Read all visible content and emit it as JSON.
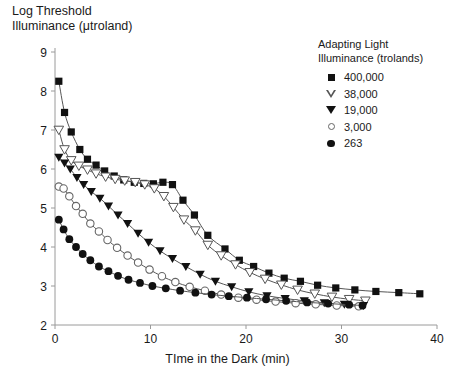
{
  "chart_data": {
    "type": "scatter",
    "title": "",
    "ylabel": "Log Threshold\nIlluminance (μtroland)",
    "xlabel": "TIme in the Dark (min)",
    "xlim": [
      0,
      40
    ],
    "ylim": [
      2,
      9
    ],
    "xticks": [
      0,
      10,
      20,
      30,
      40
    ],
    "yticks": [
      2,
      3,
      4,
      5,
      6,
      7,
      8,
      9
    ],
    "grid": false,
    "legend_position": "top-right",
    "legend_title": "Adapting Light\nIlluminance (trolands)",
    "series": [
      {
        "name": "400,000",
        "marker": "filled-square",
        "color": "#111111",
        "points": [
          [
            0.4,
            8.25
          ],
          [
            1.0,
            7.45
          ],
          [
            1.7,
            6.95
          ],
          [
            2.6,
            6.5
          ],
          [
            3.4,
            6.25
          ],
          [
            4.3,
            6.1
          ],
          [
            5.2,
            5.95
          ],
          [
            6.2,
            5.82
          ],
          [
            7.2,
            5.72
          ],
          [
            8.3,
            5.66
          ],
          [
            9.3,
            5.63
          ],
          [
            10.3,
            5.62
          ],
          [
            11.3,
            5.66
          ],
          [
            12.3,
            5.6
          ],
          [
            13.4,
            5.2
          ],
          [
            14.6,
            4.82
          ],
          [
            16.0,
            4.3
          ],
          [
            17.8,
            3.95
          ],
          [
            19.3,
            3.66
          ],
          [
            20.8,
            3.5
          ],
          [
            22.4,
            3.33
          ],
          [
            24.0,
            3.2
          ],
          [
            25.7,
            3.12
          ],
          [
            27.5,
            3.02
          ],
          [
            29.4,
            2.95
          ],
          [
            31.4,
            2.9
          ],
          [
            33.6,
            2.86
          ],
          [
            36.0,
            2.83
          ],
          [
            38.2,
            2.8
          ]
        ]
      },
      {
        "name": "38,000",
        "marker": "open-triangle-down",
        "color": "#555555",
        "points": [
          [
            0.4,
            7.0
          ],
          [
            1.0,
            6.5
          ],
          [
            1.7,
            6.22
          ],
          [
            2.5,
            6.08
          ],
          [
            3.4,
            5.98
          ],
          [
            4.3,
            5.88
          ],
          [
            5.3,
            5.8
          ],
          [
            6.3,
            5.74
          ],
          [
            7.3,
            5.7
          ],
          [
            8.4,
            5.66
          ],
          [
            9.4,
            5.6
          ],
          [
            10.4,
            5.5
          ],
          [
            11.4,
            5.3
          ],
          [
            12.4,
            5.02
          ],
          [
            13.5,
            4.7
          ],
          [
            14.7,
            4.42
          ],
          [
            16.0,
            4.05
          ],
          [
            17.4,
            3.78
          ],
          [
            18.9,
            3.55
          ],
          [
            20.4,
            3.35
          ],
          [
            22.0,
            3.18
          ],
          [
            23.7,
            3.03
          ],
          [
            25.4,
            2.9
          ],
          [
            27.2,
            2.8
          ],
          [
            29.0,
            2.72
          ],
          [
            30.8,
            2.66
          ],
          [
            32.5,
            2.62
          ]
        ]
      },
      {
        "name": "19,000",
        "marker": "filled-triangle-down",
        "color": "#111111",
        "points": [
          [
            0.4,
            6.3
          ],
          [
            1.0,
            6.15
          ],
          [
            1.6,
            6.0
          ],
          [
            2.3,
            5.78
          ],
          [
            3.0,
            5.6
          ],
          [
            3.8,
            5.42
          ],
          [
            4.7,
            5.25
          ],
          [
            5.6,
            5.05
          ],
          [
            6.6,
            4.82
          ],
          [
            7.6,
            4.6
          ],
          [
            8.7,
            4.35
          ],
          [
            9.8,
            4.12
          ],
          [
            11.0,
            3.9
          ],
          [
            12.3,
            3.7
          ],
          [
            13.7,
            3.5
          ],
          [
            15.2,
            3.3
          ],
          [
            16.8,
            3.12
          ],
          [
            18.5,
            2.98
          ],
          [
            20.3,
            2.85
          ],
          [
            22.2,
            2.75
          ],
          [
            24.1,
            2.68
          ],
          [
            26.1,
            2.62
          ],
          [
            28.2,
            2.57
          ],
          [
            30.3,
            2.53
          ],
          [
            32.3,
            2.5
          ]
        ]
      },
      {
        "name": "3,000",
        "marker": "open-circle",
        "color": "#666666",
        "points": [
          [
            0.4,
            5.55
          ],
          [
            0.9,
            5.5
          ],
          [
            1.5,
            5.3
          ],
          [
            2.2,
            5.05
          ],
          [
            2.9,
            4.85
          ],
          [
            3.7,
            4.6
          ],
          [
            4.6,
            4.4
          ],
          [
            5.5,
            4.18
          ],
          [
            6.5,
            3.98
          ],
          [
            7.6,
            3.78
          ],
          [
            8.7,
            3.6
          ],
          [
            9.9,
            3.42
          ],
          [
            11.2,
            3.25
          ],
          [
            12.6,
            3.1
          ],
          [
            14.1,
            2.98
          ],
          [
            15.7,
            2.88
          ],
          [
            17.4,
            2.78
          ],
          [
            19.2,
            2.7
          ],
          [
            21.1,
            2.65
          ],
          [
            23.1,
            2.6
          ],
          [
            25.2,
            2.56
          ],
          [
            27.3,
            2.53
          ],
          [
            29.5,
            2.5
          ],
          [
            31.8,
            2.48
          ]
        ]
      },
      {
        "name": "263",
        "marker": "filled-circle",
        "color": "#111111",
        "points": [
          [
            0.4,
            4.7
          ],
          [
            0.9,
            4.45
          ],
          [
            1.5,
            4.2
          ],
          [
            2.2,
            4.0
          ],
          [
            2.9,
            3.82
          ],
          [
            3.7,
            3.66
          ],
          [
            4.6,
            3.5
          ],
          [
            5.6,
            3.38
          ],
          [
            6.6,
            3.26
          ],
          [
            7.7,
            3.16
          ],
          [
            8.9,
            3.08
          ],
          [
            10.2,
            3.0
          ],
          [
            11.6,
            2.94
          ],
          [
            13.1,
            2.88
          ],
          [
            14.7,
            2.83
          ],
          [
            16.4,
            2.78
          ],
          [
            18.2,
            2.74
          ],
          [
            20.1,
            2.7
          ],
          [
            22.1,
            2.66
          ],
          [
            24.2,
            2.62
          ],
          [
            26.4,
            2.58
          ],
          [
            28.6,
            2.55
          ],
          [
            30.8,
            2.52
          ],
          [
            32.2,
            2.5
          ]
        ]
      }
    ]
  },
  "legend": {
    "title": "Adapting Light\nIlluminance (trolands)",
    "items": [
      {
        "label": "400,000",
        "marker": "filled-square"
      },
      {
        "label": "38,000",
        "marker": "open-triangle-down"
      },
      {
        "label": "19,000",
        "marker": "filled-triangle-down"
      },
      {
        "label": "3,000",
        "marker": "open-circle"
      },
      {
        "label": "263",
        "marker": "filled-circle"
      }
    ]
  },
  "axes": {
    "y_title": "Log Threshold\nIlluminance (μtroland)",
    "x_title": "TIme in the Dark (min)",
    "y_ticks": [
      "9",
      "8",
      "7",
      "6",
      "5",
      "4",
      "3",
      "2"
    ],
    "x_ticks": [
      "0",
      "10",
      "20",
      "30",
      "40"
    ]
  },
  "colors": {
    "axis": "#9a9a9a",
    "curve": "#555555",
    "text": "#1a1a1a"
  }
}
